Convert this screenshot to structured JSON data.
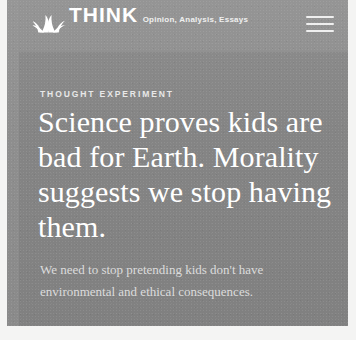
{
  "brand": {
    "logo_icon": "nbc-peacock-icon",
    "title": "THINK",
    "tagline": "Opinion, Analysis, Essays"
  },
  "nav": {
    "menu_icon": "hamburger-menu-icon",
    "menu_label": "Menu"
  },
  "article": {
    "kicker": "THOUGHT EXPERIMENT",
    "headline": "Science proves kids are bad for Earth. Morality suggests we stop having them.",
    "dek": "We need to stop pretending kids don't have environmental and ethical consequences."
  },
  "colors": {
    "page_background": "#f4f4f3",
    "card_background": "#878787",
    "masthead_background": "#8f8f8f",
    "headline_text": "#ffffff",
    "dek_text": "#dcdcdc",
    "kicker_text": "#e8e8e8"
  }
}
